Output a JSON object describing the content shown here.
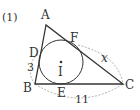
{
  "problem_number": "(1)",
  "colors": {
    "line": "#333333",
    "dash": "#999999",
    "background": "#ffffff"
  },
  "triangle": {
    "vertices": [
      {
        "label": "A",
        "x": 46,
        "y": 25
      },
      {
        "label": "B",
        "x": 35,
        "y": 84
      },
      {
        "label": "C",
        "x": 123,
        "y": 84
      }
    ]
  },
  "incircle": {
    "center_label": "I",
    "cx": 61,
    "cy": 62,
    "r": 22
  },
  "tangent_points": [
    {
      "label": "D",
      "side": "AB"
    },
    {
      "label": "E",
      "side": "BC"
    },
    {
      "label": "F",
      "side": "CA"
    }
  ],
  "lengths": [
    {
      "segment": "BD",
      "label": "3"
    },
    {
      "segment": "BC",
      "label": "11"
    },
    {
      "segment": "FC",
      "label": "x"
    }
  ]
}
